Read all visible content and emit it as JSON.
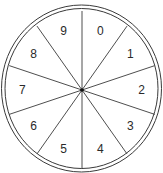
{
  "diagram": {
    "type": "spinner",
    "sector_count": 10,
    "labels": [
      "0",
      "1",
      "2",
      "3",
      "4",
      "5",
      "6",
      "7",
      "8",
      "9"
    ],
    "colors": {
      "stroke": "#3a3a3a",
      "background": "#ffffff",
      "text": "#2a2a2a"
    }
  }
}
